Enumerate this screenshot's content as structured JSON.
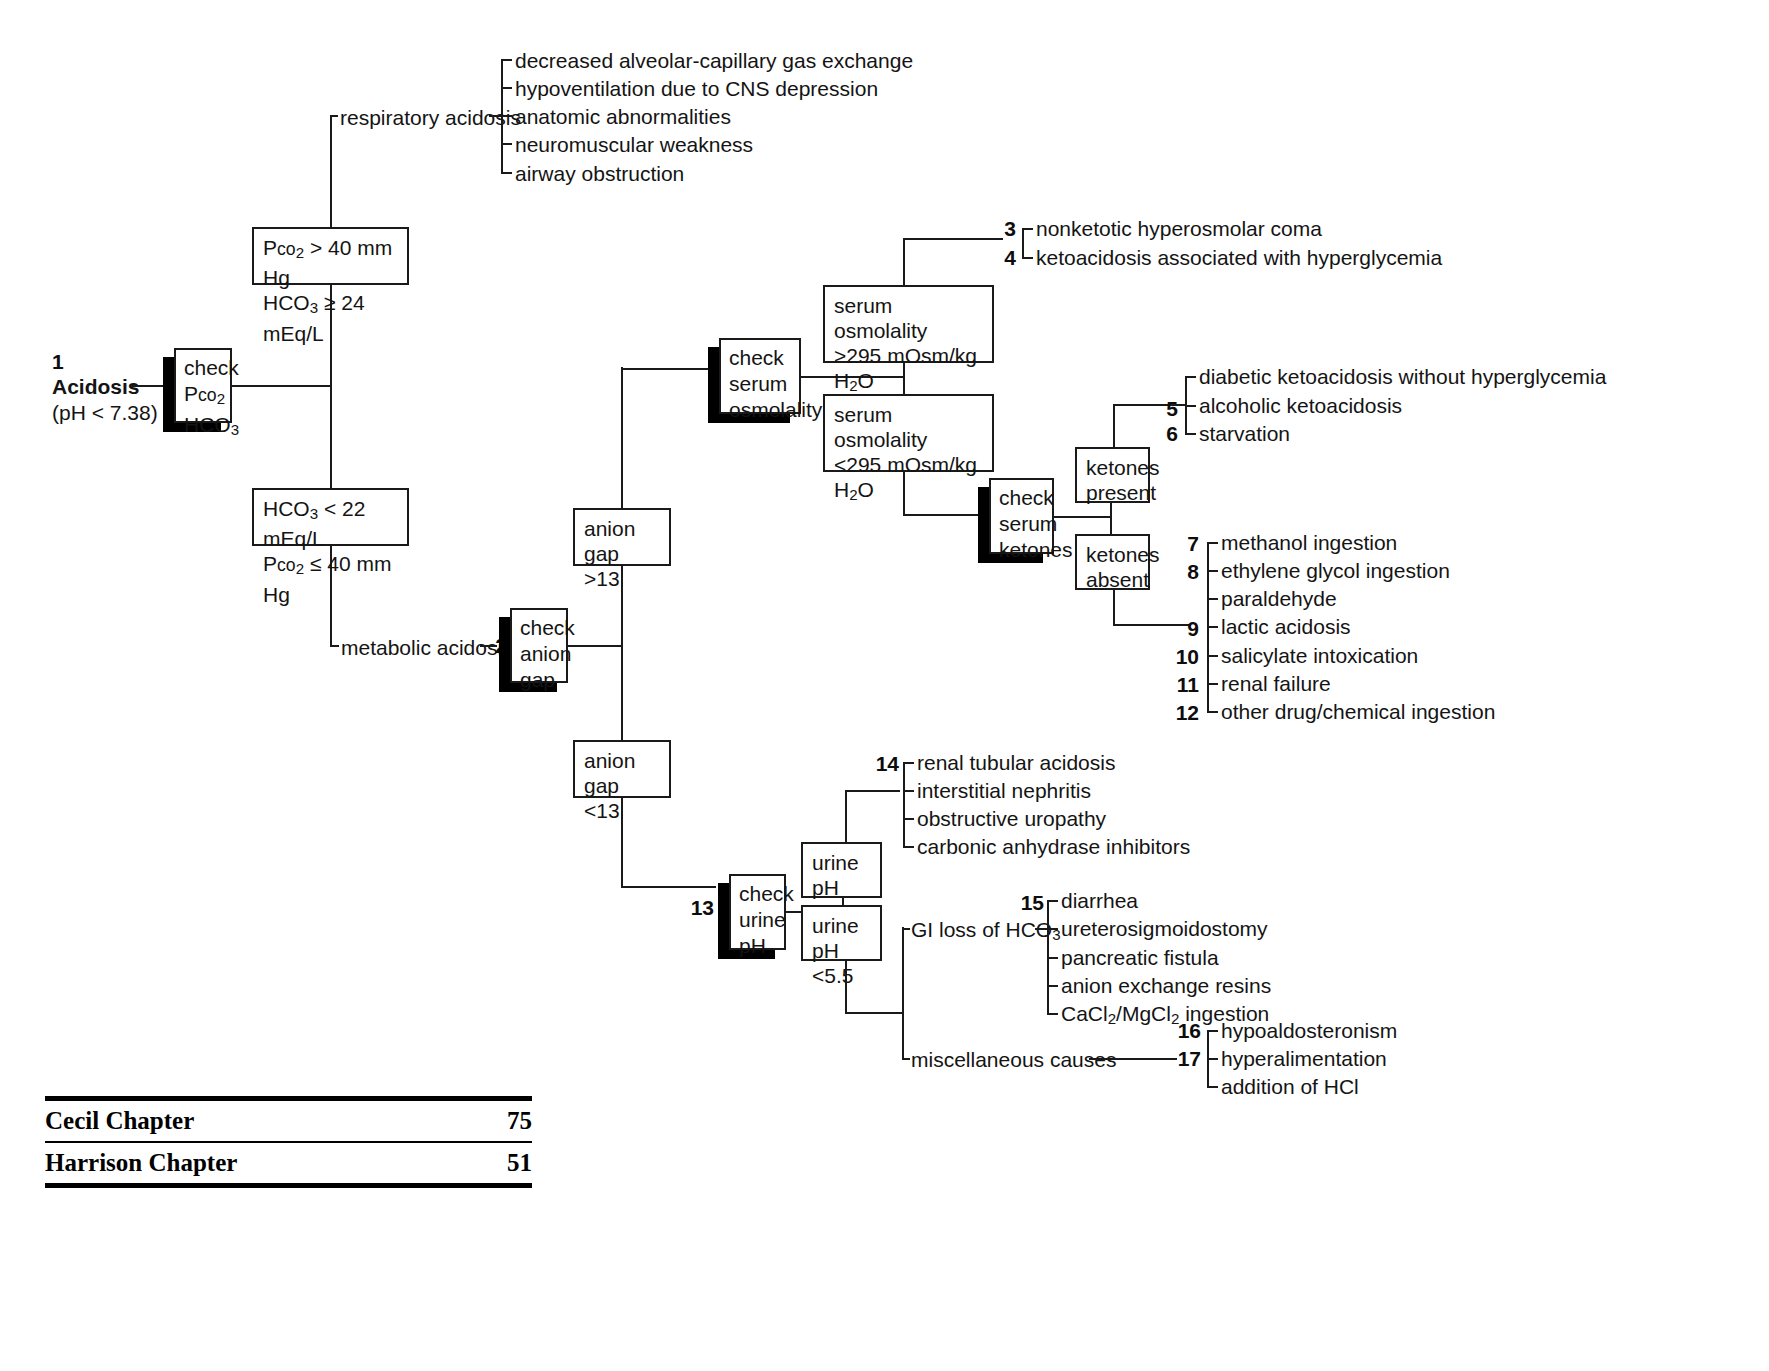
{
  "diagram": {
    "root": {
      "number": "1",
      "label": "Acidosis",
      "sublabel": "(pH < 7.38)"
    },
    "actions": {
      "check_pco2_hco3": "check\nPco2\nHCO3",
      "check_serum_osmolality": "check\nserum\nosmolality",
      "check_anion_gap": "check\nanion\ngap",
      "check_serum_ketones": "check\nserum\nketones",
      "check_urine_ph": "check\nurine\npH"
    },
    "action_numbers": {
      "anion_gap": "2",
      "urine_ph": "13"
    },
    "boxes": {
      "resp_criteria_line1": "Pco2 > 40 mm Hg",
      "resp_criteria_line2": "HCO3 ≥ 24 mEq/L",
      "metab_criteria_line1": "HCO3 < 22 mEq/L",
      "metab_criteria_line2": "Pco2 ≤ 40 mm Hg",
      "osm_high_line1": "serum",
      "osm_high_line2": "osmolality",
      "osm_high_line3": ">295 mOsm/kg H2O",
      "osm_low_line1": "serum",
      "osm_low_line2": "osmolality",
      "osm_low_line3": "<295 mOsm/kg H2O",
      "anion_gap_high_line1": "anion gap",
      "anion_gap_high_line2": ">13",
      "anion_gap_low_line1": "anion gap",
      "anion_gap_low_line2": "<13",
      "ketones_present_line1": "ketones",
      "ketones_present_line2": "present",
      "ketones_absent_line1": "ketones",
      "ketones_absent_line2": "absent",
      "urine_ph_high_line1": "urine pH",
      "urine_ph_high_line2": ">5.5",
      "urine_ph_low_line1": "urine pH",
      "urine_ph_low_line2": "<5.5"
    },
    "branch_labels": {
      "respiratory_acidosis": "respiratory acidosis",
      "metabolic_acidosis": "metabolic acidosis",
      "gi_loss": "GI loss of HCO3",
      "misc_causes": "miscellaneous causes"
    },
    "respiratory_causes": [
      {
        "num": "",
        "text": "decreased alveolar-capillary gas exchange"
      },
      {
        "num": "",
        "text": "hypoventilation due to CNS depression"
      },
      {
        "num": "",
        "text": "anatomic abnormalities"
      },
      {
        "num": "",
        "text": "neuromuscular weakness"
      },
      {
        "num": "",
        "text": "airway obstruction"
      }
    ],
    "hyperosmolar_causes": [
      {
        "num": "3",
        "text": "nonketotic hyperosmolar coma"
      },
      {
        "num": "4",
        "text": "ketoacidosis associated with hyperglycemia"
      }
    ],
    "ketones_present_causes": [
      {
        "num": "",
        "text": "diabetic ketoacidosis without hyperglycemia"
      },
      {
        "num": "5",
        "text": "alcoholic ketoacidosis"
      },
      {
        "num": "6",
        "text": "starvation"
      }
    ],
    "ketones_absent_causes": [
      {
        "num": "7",
        "text": "methanol ingestion"
      },
      {
        "num": "8",
        "text": "ethylene glycol ingestion"
      },
      {
        "num": "",
        "text": "paraldehyde"
      },
      {
        "num": "9",
        "text": "lactic acidosis"
      },
      {
        "num": "10",
        "text": "salicylate intoxication"
      },
      {
        "num": "11",
        "text": "renal failure"
      },
      {
        "num": "12",
        "text": "other drug/chemical ingestion"
      }
    ],
    "urine_ph_high_causes": [
      {
        "num": "14",
        "text": "renal tubular acidosis"
      },
      {
        "num": "",
        "text": "interstitial nephritis"
      },
      {
        "num": "",
        "text": "obstructive uropathy"
      },
      {
        "num": "",
        "text": "carbonic anhydrase inhibitors"
      }
    ],
    "gi_loss_causes": [
      {
        "num": "15",
        "text": "diarrhea"
      },
      {
        "num": "",
        "text": "ureterosigmoidostomy"
      },
      {
        "num": "",
        "text": "pancreatic fistula"
      },
      {
        "num": "",
        "text": "anion exchange resins"
      },
      {
        "num": "",
        "text": "CaCl2/MgCl2 ingestion"
      }
    ],
    "misc_causes_list": [
      {
        "num": "16",
        "text": "hypoaldosteronism"
      },
      {
        "num": "17",
        "text": "hyperalimentation"
      },
      {
        "num": "",
        "text": "addition of HCl"
      }
    ]
  },
  "footer": {
    "rows": [
      {
        "label": "Cecil Chapter",
        "value": "75"
      },
      {
        "label": "Harrison Chapter",
        "value": "51"
      }
    ]
  }
}
